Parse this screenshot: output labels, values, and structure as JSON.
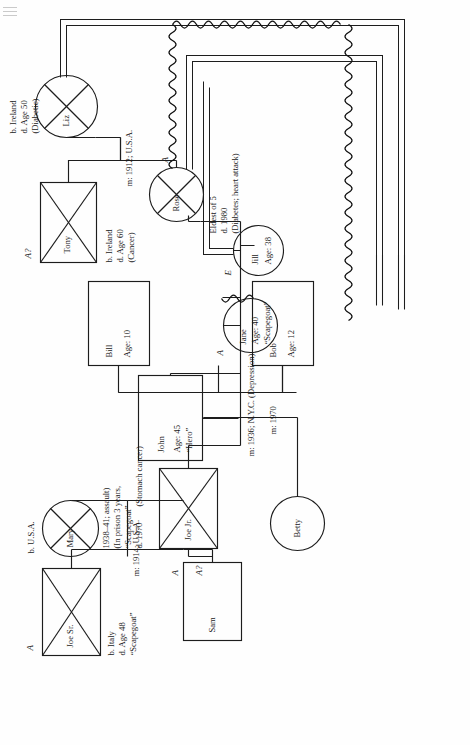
{
  "diagram": {
    "orientation": "page rotated 90 degrees counter-clockwise",
    "corner_artifact": "scan-mark"
  },
  "people": {
    "tony": {
      "name": "Tony",
      "shape": "square",
      "deceased": true,
      "notes": [
        "b. Ireland",
        "d. Age 60",
        "(Cancer)"
      ],
      "role_code": "A?"
    },
    "liz": {
      "name": "Liz",
      "shape": "circle",
      "deceased": true,
      "notes": [
        "b. Ireland",
        "d. Age 50",
        "(Diabetic)"
      ],
      "role_code": ""
    },
    "rose": {
      "name": "Rose",
      "shape": "circle",
      "deceased": true,
      "notes": [
        "Eldest of 5",
        "d. 1980",
        "(Diabetes; heart attack)"
      ],
      "role_code": "A"
    },
    "joesr": {
      "name": "Joe Sr.",
      "shape": "square",
      "deceased": true,
      "notes": [
        "b. Italy",
        "d. Age 48",
        "“Scapegoat”"
      ],
      "role_code": "A"
    },
    "mary": {
      "name": "Mary",
      "shape": "circle",
      "deceased": true,
      "notes": [
        "b. U.S.A."
      ],
      "role_code": ""
    },
    "joejr": {
      "name": "Joe Jr.",
      "shape": "square",
      "deceased": true,
      "notes": [
        "d. 1970",
        "(Stomach cancer)",
        "“Scapegoat”",
        "(In prison 3 years,",
        "1938–41; assault)"
      ],
      "role_code": "A"
    },
    "sam": {
      "name": "Sam",
      "shape": "square",
      "deceased": false,
      "notes": [],
      "role_code": "A?"
    },
    "john": {
      "name": "John",
      "shape": "square",
      "deceased": false,
      "age_line": "Age: 45",
      "tag_line": "“Hero”",
      "notes": [],
      "role_code": ""
    },
    "jane": {
      "name": "Jane",
      "shape": "circle",
      "deceased": false,
      "age_line": "Age: 40",
      "tag_line": "“Scapegoat”",
      "notes": [],
      "role_code": "A"
    },
    "jill": {
      "name": "Jill",
      "shape": "circle",
      "deceased": false,
      "age_line": "Age: 38",
      "tag_line": "",
      "notes": [],
      "role_code": "E"
    },
    "betty": {
      "name": "Betty",
      "shape": "circle",
      "deceased": false,
      "notes": [],
      "role_code": ""
    },
    "bill": {
      "name": "Bill",
      "shape": "square",
      "deceased": false,
      "age_line": "Age: 10",
      "notes": [],
      "role_code": ""
    },
    "bob": {
      "name": "Bob",
      "shape": "square",
      "deceased": false,
      "age_line": "Age: 12",
      "notes": [],
      "role_code": ""
    }
  },
  "marriages": {
    "tony_liz": "m: 1912; U.S.A.",
    "joesr_mary": "m: 1914; U.S.A.",
    "joejr_rose": "m: 1936; N.Y.C. (Depression)",
    "john_betty": "m: 1970"
  },
  "annotations": {
    "rose_block": [
      "Eldest of 5",
      "d. 1980",
      "(Diabetes; heart attack)"
    ],
    "joejr_block": [
      "d. 1970",
      "(Stomach cancer)",
      "“Scapegoat”",
      "(In prison 3 years,",
      "1938–41; assault)"
    ],
    "tony_block": [
      "b. Ireland",
      "d. Age 60",
      "(Cancer)"
    ],
    "liz_block": [
      "b. Ireland",
      "d. Age 50",
      "(Diabetic)"
    ],
    "joesr_block": [
      "b. Italy",
      "d. Age 48",
      "“Scapegoat”"
    ],
    "mary_block": [
      "b. U.S.A."
    ]
  },
  "relationship_codes": {
    "tony": "A?",
    "rose": "A",
    "joesr": "A",
    "joejr": "A",
    "sam": "A?",
    "jane": "A",
    "jill": "E"
  },
  "style": {
    "line_color": "#1d1d1d",
    "wavy_color": "#111111",
    "paper": "#fefefe"
  }
}
